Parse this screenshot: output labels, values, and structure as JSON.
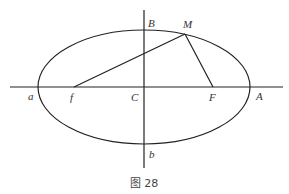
{
  "figure": {
    "caption": "图 28",
    "ellipse": {
      "cx": 144,
      "cy": 87,
      "rx": 106,
      "ry": 57
    },
    "axes": {
      "horizontal": {
        "x1": 10,
        "y1": 87,
        "x2": 283,
        "y2": 87
      },
      "vertical": {
        "x1": 144,
        "y1": 10,
        "x2": 144,
        "y2": 168
      }
    },
    "points": {
      "a": {
        "label": "a",
        "x": 38,
        "y": 87
      },
      "A": {
        "label": "A",
        "x": 250,
        "y": 87
      },
      "B": {
        "label": "B",
        "x": 144,
        "y": 30
      },
      "b": {
        "label": "b",
        "x": 144,
        "y": 144
      },
      "C": {
        "label": "C",
        "x": 144,
        "y": 87
      },
      "f": {
        "label": "f",
        "x": 74,
        "y": 87
      },
      "F": {
        "label": "F",
        "x": 213,
        "y": 87
      },
      "M": {
        "label": "M",
        "x": 185,
        "y": 34
      }
    },
    "segments": [
      {
        "from": "f",
        "to": "M"
      },
      {
        "from": "M",
        "to": "F"
      }
    ],
    "colors": {
      "line": "#222222",
      "text": "#333333",
      "background": "#ffffff"
    }
  }
}
